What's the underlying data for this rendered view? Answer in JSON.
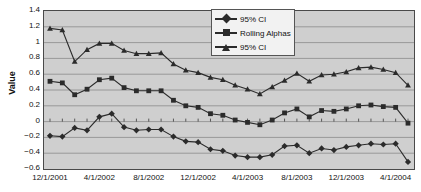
{
  "chart_data": {
    "type": "line",
    "title": "",
    "xlabel": "",
    "ylabel": "Value",
    "ylim": [
      -0.6,
      1.4
    ],
    "yticks": [
      "1.4",
      "1.2",
      "1",
      "0.8",
      "0.6",
      "0.4",
      "0.2",
      "0",
      "-0.2",
      "-0.4",
      "-0.6"
    ],
    "ytick_values": [
      1.4,
      1.2,
      1.0,
      0.8,
      0.6,
      0.4,
      0.2,
      0.0,
      -0.2,
      -0.4,
      -0.6
    ],
    "grid": true,
    "legend_position": "top-center",
    "plot_background": "#cfcfcf",
    "series_color": "#2b2b2b",
    "x_tick_labels": [
      "12/1/2001",
      "4/1/2002",
      "8/1/2002",
      "12/1/2002",
      "4/1/2003",
      "8/1/2003",
      "12/1/2003",
      "4/1/2004"
    ],
    "x_tick_indices": [
      0,
      4,
      8,
      12,
      16,
      20,
      24,
      28
    ],
    "x": [
      "12/1/2001",
      "1/1/2002",
      "2/1/2002",
      "3/1/2002",
      "4/1/2002",
      "5/1/2002",
      "6/1/2002",
      "7/1/2002",
      "8/1/2002",
      "9/1/2002",
      "10/1/2002",
      "11/1/2002",
      "12/1/2002",
      "1/1/2003",
      "2/1/2003",
      "3/1/2003",
      "4/1/2003",
      "5/1/2003",
      "6/1/2003",
      "7/1/2003",
      "8/1/2003",
      "9/1/2003",
      "10/1/2003",
      "11/1/2003",
      "12/1/2003",
      "1/1/2004",
      "2/1/2004",
      "3/1/2004",
      "4/1/2004",
      "5/1/2004"
    ],
    "series": [
      {
        "name": "95% CI",
        "marker": "diamond",
        "values": [
          -0.18,
          -0.19,
          -0.08,
          -0.11,
          0.06,
          0.1,
          -0.07,
          -0.11,
          -0.1,
          -0.1,
          -0.19,
          -0.25,
          -0.26,
          -0.35,
          -0.37,
          -0.43,
          -0.45,
          -0.45,
          -0.42,
          -0.31,
          -0.3,
          -0.4,
          -0.34,
          -0.36,
          -0.32,
          -0.3,
          -0.28,
          -0.29,
          -0.28,
          -0.51
        ]
      },
      {
        "name": "Rolling Alphas",
        "marker": "square",
        "values": [
          0.51,
          0.49,
          0.34,
          0.41,
          0.53,
          0.55,
          0.43,
          0.39,
          0.39,
          0.39,
          0.27,
          0.2,
          0.18,
          0.1,
          0.08,
          0.02,
          -0.01,
          -0.04,
          0.02,
          0.11,
          0.16,
          0.06,
          0.14,
          0.13,
          0.16,
          0.2,
          0.21,
          0.19,
          0.18,
          -0.02
        ]
      },
      {
        "name": "95% CI",
        "marker": "triangle",
        "values": [
          1.18,
          1.16,
          0.76,
          0.91,
          0.99,
          0.99,
          0.9,
          0.86,
          0.86,
          0.87,
          0.73,
          0.65,
          0.62,
          0.56,
          0.53,
          0.46,
          0.41,
          0.35,
          0.44,
          0.52,
          0.61,
          0.51,
          0.59,
          0.6,
          0.63,
          0.68,
          0.69,
          0.66,
          0.62,
          0.46
        ]
      }
    ]
  },
  "legend": {
    "entries": [
      {
        "label": "95% CI",
        "marker": "diamond"
      },
      {
        "label": "Rolling Alphas",
        "marker": "square"
      },
      {
        "label": "95% CI",
        "marker": "triangle"
      }
    ]
  }
}
